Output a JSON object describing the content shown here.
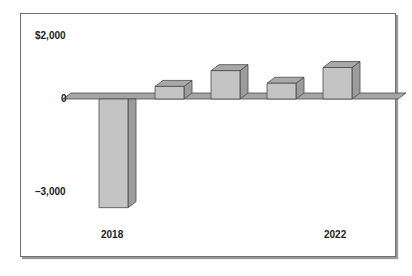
{
  "chart_data": {
    "type": "bar",
    "style": "3d-column",
    "title": "",
    "xlabel": "",
    "ylabel": "",
    "categories": [
      "2018",
      "2019",
      "2020",
      "2021",
      "2022"
    ],
    "values": [
      -3450,
      400,
      900,
      500,
      1000
    ],
    "x_tick_labels_shown": [
      "2018",
      "2022"
    ],
    "y_tick_labels": [
      "$2,000",
      "0",
      "–3,000"
    ],
    "ylim": [
      -3500,
      2000
    ],
    "grid": false,
    "legend": null,
    "colors": {
      "bar_front": "#c4c4c4",
      "bar_top": "#a8a8a8",
      "bar_side": "#9c9c9c",
      "floor": "#a5a5a5",
      "edge": "#4a4a4a"
    }
  },
  "axis": {
    "y_top": "$2,000",
    "y_zero": "0",
    "y_bottom": "–3,000",
    "x_first": "2018",
    "x_last": "2022"
  }
}
